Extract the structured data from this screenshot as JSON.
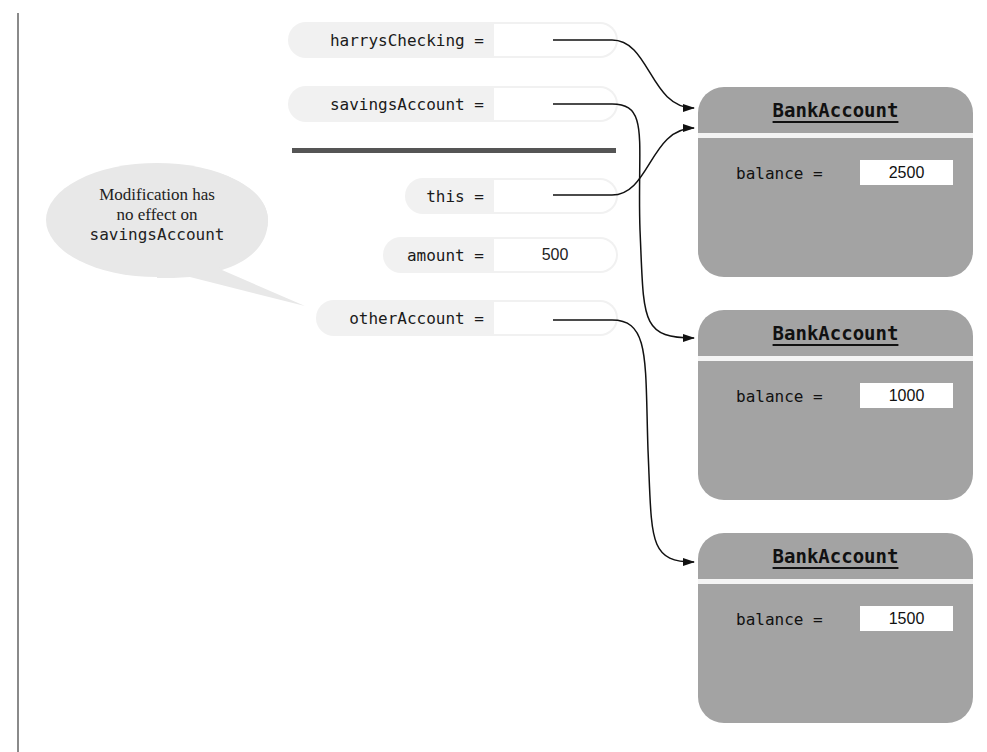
{
  "variables": [
    {
      "name": "harrysChecking",
      "label": "harrysChecking =",
      "value": "",
      "points_to": 0
    },
    {
      "name": "savingsAccount",
      "label": "savingsAccount =",
      "value": "",
      "points_to": 1
    },
    {
      "name": "this",
      "label": "this =",
      "value": "",
      "points_to": 0
    },
    {
      "name": "amount",
      "label": "amount =",
      "value": "500"
    },
    {
      "name": "otherAccount",
      "label": "otherAccount =",
      "value": "",
      "points_to": 2
    }
  ],
  "callout": {
    "line1": "Modification has",
    "line2": "no effect on",
    "line3": "savingsAccount"
  },
  "objects": [
    {
      "title": "BankAccount",
      "field_label": "balance =",
      "field_value": "2500"
    },
    {
      "title": "BankAccount",
      "field_label": "balance =",
      "field_value": "1000"
    },
    {
      "title": "BankAccount",
      "field_label": "balance =",
      "field_value": "1500"
    }
  ],
  "colors": {
    "object_fill": "#a3a3a3",
    "pill_fill": "#f1f1f1",
    "separator": "#555555",
    "callout_fill": "#e6e6e6"
  }
}
